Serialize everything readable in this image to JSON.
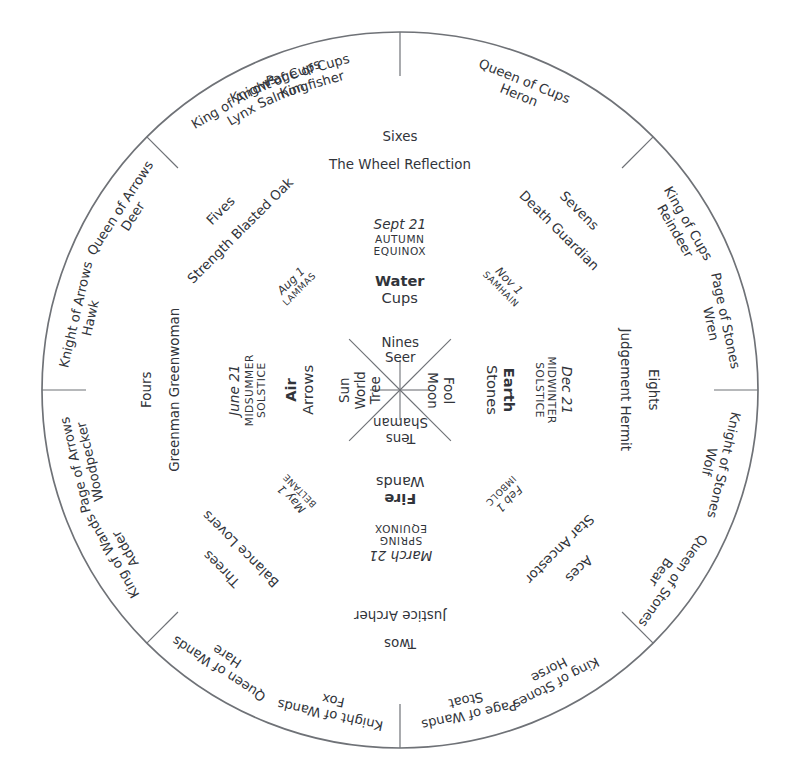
{
  "diagram": {
    "center_x": 400,
    "center_y": 390,
    "radius": 358,
    "stroke_color": "#6f7277",
    "text_color": "#31343a",
    "background": "#ffffff"
  },
  "center_star": {
    "name": "eight-spoke-star",
    "short_spoke_length": 30,
    "long_spoke_length": 72
  },
  "rim_ticks": [
    {
      "angle": 0,
      "label": "tick-top"
    },
    {
      "angle": 45,
      "label": "tick-upper-right"
    },
    {
      "angle": 90,
      "label": "tick-right"
    },
    {
      "angle": 135,
      "label": "tick-lower-right"
    },
    {
      "angle": 180,
      "label": "tick-bottom"
    },
    {
      "angle": 225,
      "label": "tick-lower-left"
    },
    {
      "angle": 270,
      "label": "tick-left"
    },
    {
      "angle": 315,
      "label": "tick-upper-left"
    }
  ],
  "court_cards": [
    {
      "angle": -22,
      "lines": [
        "Knight of Cups",
        "Salmon"
      ]
    },
    {
      "angle": 22,
      "lines": [
        "Queen of Cups",
        "Heron"
      ]
    },
    {
      "angle": 60,
      "lines": [
        "King of Cups",
        "Reindeer"
      ]
    },
    {
      "angle": 78,
      "lines": [
        "Page of Stones",
        "Wren"
      ]
    },
    {
      "angle": 103,
      "lines": [
        "Knight of Stones",
        "Wolf"
      ]
    },
    {
      "angle": 125,
      "lines": [
        "Queen of Stones",
        "Bear"
      ]
    },
    {
      "angle": 152,
      "lines": [
        "King of Stones",
        "Horse"
      ]
    },
    {
      "angle": 168,
      "lines": [
        "Page of Wands",
        "Stoat"
      ]
    },
    {
      "angle": 192,
      "lines": [
        "Knight of Wands",
        "Fox"
      ]
    },
    {
      "angle": 213,
      "lines": [
        "Queen of Wands",
        "Hare"
      ]
    },
    {
      "angle": 240,
      "lines": [
        "King of Wands",
        "Adder"
      ]
    },
    {
      "angle": 257,
      "lines": [
        "Page of Arrows",
        "Woodpecker"
      ]
    },
    {
      "angle": 283,
      "lines": [
        "Knight of Arrows",
        "Hawk"
      ]
    },
    {
      "angle": 303,
      "lines": [
        "Queen of Arrows",
        "Deer"
      ]
    },
    {
      "angle": 330,
      "lines": [
        "King of Arrows",
        "Lynx"
      ]
    },
    {
      "angle": 344,
      "lines": [
        "Page of Cups",
        "Kingfisher"
      ]
    }
  ],
  "number_cards": [
    {
      "angle": 0,
      "number": "Sixes",
      "majors": "The Wheel Reflection"
    },
    {
      "angle": 45,
      "number": "Sevens",
      "majors": "Death Guardian"
    },
    {
      "angle": 90,
      "number": "Eights",
      "majors": "Judgement Hermit"
    },
    {
      "angle": 135,
      "number": "Aces",
      "majors": "Star Ancestor"
    },
    {
      "angle": 180,
      "number": "Twos",
      "majors": "Justice Archer"
    },
    {
      "angle": 225,
      "number": "Threes",
      "majors": "Balance Lovers"
    },
    {
      "angle": 270,
      "number": "Fours",
      "majors": "Greenman Greenwoman"
    },
    {
      "angle": 315,
      "number": "Fives",
      "majors": "Strength Blasted Oak"
    }
  ],
  "cross_quarters": [
    {
      "angle": 45,
      "date": "Nov 1",
      "festival": "SAMHAIN"
    },
    {
      "angle": 135,
      "date": "Feb 1",
      "festival": "IMBOLC"
    },
    {
      "angle": 225,
      "date": "May 1",
      "festival": "BELTANE"
    },
    {
      "angle": 315,
      "date": "Aug 1",
      "festival": "LAMMAS"
    }
  ],
  "quarters": [
    {
      "angle": 0,
      "date": "Sept 21",
      "festival_line1": "AUTUMN",
      "festival_line2": "EQUINOX",
      "element": "Water",
      "suit": "Cups",
      "inner_number": "Nines",
      "inner_major": "Seer"
    },
    {
      "angle": 90,
      "date": "Dec 21",
      "festival_line1": "MIDWINTER",
      "festival_line2": "SOLSTICE",
      "element": "Earth",
      "suit": "Stones",
      "inner_number": "Fool",
      "inner_major": "Moon"
    },
    {
      "angle": 180,
      "date": "March 21",
      "festival_line1": "SPRING",
      "festival_line2": "EQUINOX",
      "element": "Fire",
      "suit": "Wands",
      "inner_number": "Tens",
      "inner_major": "Shaman"
    },
    {
      "angle": 270,
      "date": "June 21",
      "festival_line1": "MIDSUMMER",
      "festival_line2": "SOLSTICE",
      "element": "Air",
      "suit": "Arrows",
      "inner_number": "Sun",
      "inner_major": "World",
      "inner_extra": "Tree"
    }
  ]
}
